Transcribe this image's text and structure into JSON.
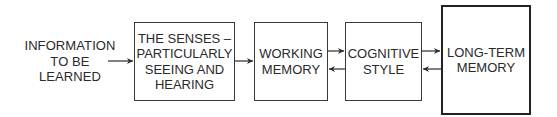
{
  "diagram": {
    "input_label": "INFORMATION\nTO BE\nLEARNED",
    "nodes": [
      {
        "id": "senses",
        "label": "THE SENSES –\nPARTICULARLY\nSEEING AND\nHEARING"
      },
      {
        "id": "working_memory",
        "label": "WORKING\nMEMORY"
      },
      {
        "id": "cognitive_style",
        "label": "COGNITIVE\nSTYLE"
      },
      {
        "id": "long_term_memory",
        "label": "LONG-TERM\nMEMORY"
      }
    ],
    "edges": [
      {
        "from": "input",
        "to": "senses"
      },
      {
        "from": "senses",
        "to": "working_memory"
      },
      {
        "from": "working_memory",
        "to": "cognitive_style"
      },
      {
        "from": "cognitive_style",
        "to": "working_memory"
      },
      {
        "from": "cognitive_style",
        "to": "long_term_memory"
      },
      {
        "from": "long_term_memory",
        "to": "cognitive_style"
      }
    ]
  }
}
